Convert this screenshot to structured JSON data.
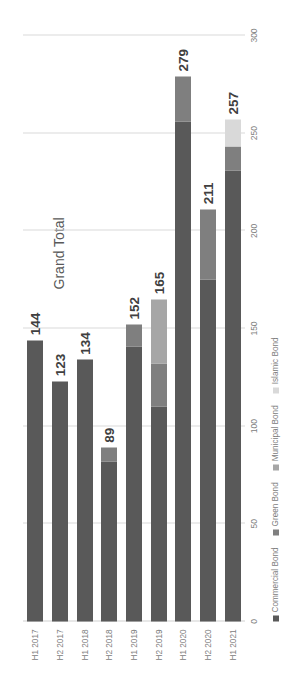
{
  "chart_data": {
    "type": "bar",
    "orientation": "horizontal-stacked",
    "title": "Grand Total",
    "xlabel": "",
    "ylabel": "",
    "categories": [
      "H1 2017",
      "H2 2017",
      "H1 2018",
      "H2 2018",
      "H1 2019",
      "H2 2019",
      "H1 2020",
      "H2 2020",
      "H1 2021"
    ],
    "axis_ticks": [
      "0",
      "50",
      "100",
      "150",
      "200",
      "250",
      "300"
    ],
    "xlim": [
      0,
      300
    ],
    "grid": true,
    "legend_position": "bottom",
    "series": [
      {
        "name": "Commercial Bond",
        "color": "#595959",
        "values": [
          144,
          123,
          134,
          82,
          141,
          110,
          256,
          175,
          231
        ]
      },
      {
        "name": "Green Bond",
        "color": "#7f7f7f",
        "values": [
          0,
          0,
          0,
          7,
          11,
          22,
          23,
          36,
          12
        ]
      },
      {
        "name": "Municipal Bond",
        "color": "#a6a6a6",
        "values": [
          0,
          0,
          0,
          0,
          0,
          33,
          0,
          0,
          0
        ]
      },
      {
        "name": "Islamic Bond",
        "color": "#d9d9d9",
        "values": [
          0,
          0,
          0,
          0,
          0,
          0,
          0,
          0,
          14
        ]
      }
    ],
    "totals": [
      144,
      123,
      134,
      89,
      152,
      165,
      279,
      211,
      257
    ],
    "total_labels": [
      "144",
      "123",
      "134",
      "89",
      "152",
      "165",
      "279",
      "211",
      "257"
    ]
  },
  "legend": {
    "items": [
      {
        "label": "Commercial Bond",
        "color": "#595959"
      },
      {
        "label": "Green Bond",
        "color": "#7f7f7f"
      },
      {
        "label": "Municipal Bond",
        "color": "#a6a6a6"
      },
      {
        "label": "Islamic Bond",
        "color": "#d9d9d9"
      }
    ]
  }
}
